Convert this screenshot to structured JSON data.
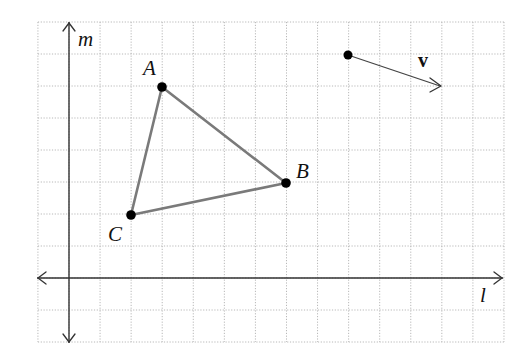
{
  "figure": {
    "width": 524,
    "height": 357,
    "grid": {
      "origin_px": [
        69,
        278
      ],
      "unit_px": [
        31.07,
        32.0
      ],
      "x_range": [
        -1,
        14
      ],
      "y_range": [
        -2,
        8
      ],
      "color": "#b8b8b8",
      "style": "dotted"
    },
    "axes": {
      "horizontal": {
        "label": "l",
        "arrows": "both"
      },
      "vertical": {
        "label": "m",
        "arrows": "both"
      }
    },
    "triangle": {
      "edge_color": "#7a7a7a",
      "vertices": [
        {
          "name": "A",
          "grid": [
            3,
            6
          ]
        },
        {
          "name": "B",
          "grid": [
            7,
            3
          ]
        },
        {
          "name": "C",
          "grid": [
            2,
            2
          ]
        }
      ]
    },
    "vector": {
      "label": "v",
      "tail_grid": [
        9,
        7
      ],
      "head_grid": [
        12,
        6
      ],
      "components": [
        3,
        -1
      ]
    }
  },
  "labels": {
    "axis_l": "l",
    "axis_m": "m",
    "point_A": "A",
    "point_B": "B",
    "point_C": "C",
    "vector_v": "v"
  }
}
